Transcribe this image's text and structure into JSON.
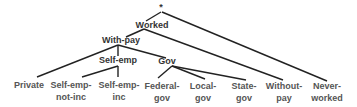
{
  "diagram": {
    "type": "tree",
    "root": "*",
    "internal_nodes": {
      "worked": "Worked",
      "with_pay": "With-pay",
      "self_emp": "Self-emp",
      "gov": "Gov"
    },
    "leaves": {
      "private": {
        "line1": "Private",
        "line2": ""
      },
      "self_emp_not_inc": {
        "line1": "Self-emp-",
        "line2": "not-inc"
      },
      "self_emp_inc": {
        "line1": "Self-emp-",
        "line2": "inc"
      },
      "federal_gov": {
        "line1": "Federal-",
        "line2": "gov"
      },
      "local_gov": {
        "line1": "Local-",
        "line2": "gov"
      },
      "state_gov": {
        "line1": "State-",
        "line2": "gov"
      },
      "without_pay": {
        "line1": "Without-",
        "line2": "pay"
      },
      "never_worked": {
        "line1": "Never-",
        "line2": "worked"
      }
    },
    "edges": [
      [
        "*",
        "Worked"
      ],
      [
        "*",
        "Never-worked"
      ],
      [
        "Worked",
        "With-pay"
      ],
      [
        "Worked",
        "Without-pay"
      ],
      [
        "With-pay",
        "Private"
      ],
      [
        "With-pay",
        "Self-emp"
      ],
      [
        "With-pay",
        "Gov"
      ],
      [
        "Self-emp",
        "Self-emp-not-inc"
      ],
      [
        "Self-emp",
        "Self-emp-inc"
      ],
      [
        "Gov",
        "Federal-gov"
      ],
      [
        "Gov",
        "Local-gov"
      ],
      [
        "Gov",
        "State-gov"
      ]
    ]
  }
}
